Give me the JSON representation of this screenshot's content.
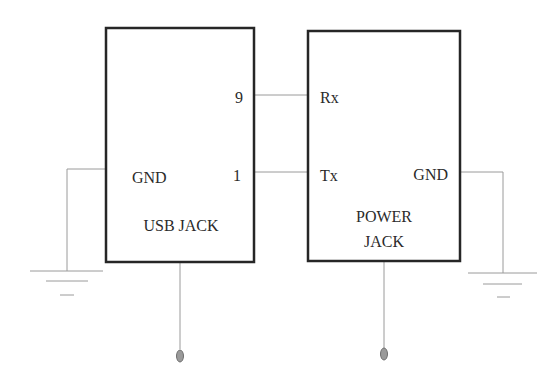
{
  "diagram": {
    "type": "schematic",
    "components": [
      {
        "id": "usb_jack",
        "name": "USB JACK",
        "pins": [
          {
            "label": "9",
            "side": "right"
          },
          {
            "label": "1",
            "side": "right"
          },
          {
            "label": "GND",
            "side": "left"
          }
        ]
      },
      {
        "id": "power_jack",
        "name_line1": "POWER",
        "name_line2": "JACK",
        "pins": [
          {
            "label": "Rx",
            "side": "left"
          },
          {
            "label": "Tx",
            "side": "left"
          },
          {
            "label": "GND",
            "side": "right"
          }
        ]
      }
    ],
    "connections": [
      {
        "from": "USB JACK pin 9",
        "to": "POWER JACK Rx"
      },
      {
        "from": "USB JACK pin 1",
        "to": "POWER JACK Tx"
      },
      {
        "from": "USB JACK GND",
        "to": "ground"
      },
      {
        "from": "POWER JACK GND",
        "to": "ground"
      },
      {
        "from": "USB JACK bottom",
        "to": "terminal"
      },
      {
        "from": "POWER JACK bottom",
        "to": "terminal"
      }
    ],
    "colors": {
      "box_stroke": "#262626",
      "wire": "#9a9a9a",
      "text": "#2a2a2a",
      "terminal": "#9a9a9a"
    }
  },
  "labels": {
    "usb": {
      "pin9": "9",
      "pin1": "1",
      "gnd": "GND",
      "title": "USB JACK"
    },
    "power": {
      "rx": "Rx",
      "tx": "Tx",
      "gnd": "GND",
      "title_line1": "POWER",
      "title_line2": "JACK"
    }
  }
}
